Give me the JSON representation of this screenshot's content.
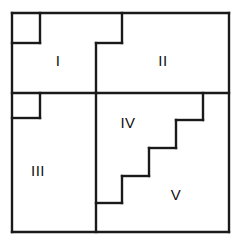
{
  "figure": {
    "background_color": "#ffffff",
    "line_color": "#1a1a1a",
    "label_color": "#111111",
    "canvas": {
      "width": 241,
      "height": 245
    },
    "outer_frame": {
      "left": 12,
      "top": 13,
      "right": 229,
      "bottom": 232
    }
  },
  "regions": [
    {
      "id": "region-1",
      "label": "I",
      "label_x": 58,
      "label_y": 62,
      "outline": "M 40 13 L 122 13 L 122 43 L 96 43 L 96 93 L 40 93 Z",
      "notes": "upper-left region beside the small empty square notch"
    },
    {
      "id": "region-2",
      "label": "II",
      "label_x": 163,
      "label_y": 62,
      "outline": "M 122 13 L 229 13 L 229 93 L 96 93 L 96 43 L 122 43 Z",
      "notes": "upper-right region"
    },
    {
      "id": "region-3",
      "label": "III",
      "label_x": 38,
      "label_y": 172,
      "outline": "M 12 118 L 40 118 L 40 93 L 96 93 L 96 232 L 12 232 Z",
      "notes": "lower-left region"
    },
    {
      "id": "region-4",
      "label": "IV",
      "label_x": 128,
      "label_y": 124,
      "outline": "M 96 93 L 229 93 L 229 94 L 203 94 L 203 120 L 176 120 L 176 148 L 149 148 L 149 176 L 122 176 L 122 203 L 96 203 Z",
      "notes": "middle region bounded below-right by a descending staircase"
    },
    {
      "id": "region-5",
      "label": "V",
      "label_x": 176,
      "label_y": 196,
      "outline": "M 203 94 L 229 94 L 229 232 L 96 232 L 96 203 L 122 203 L 122 176 L 149 176 L 149 148 L 176 148 L 176 120 L 203 120 Z",
      "notes": "lower-right region under the staircase"
    }
  ],
  "notch": {
    "id": "corner-notch",
    "label": "",
    "rect": {
      "x": 12,
      "y": 13,
      "width": 28,
      "height": 30
    },
    "notes": "small empty square cut out of the top-left corner"
  },
  "segments": [
    {
      "name": "outer-top-border",
      "d": "M 12 13 L 229 13"
    },
    {
      "name": "outer-right-border",
      "d": "M 229 13 L 229 232"
    },
    {
      "name": "outer-bottom-border",
      "d": "M 229 232 L 12 232"
    },
    {
      "name": "outer-left-border",
      "d": "M 12 232 L 12 13"
    },
    {
      "name": "notch-bottom-edge",
      "d": "M 12 43 L 40 43"
    },
    {
      "name": "notch-right-edge",
      "d": "M 40 13 L 40 43"
    },
    {
      "name": "region1-right-step-top",
      "d": "M 122 13 L 122 43"
    },
    {
      "name": "region1-step-horizontal",
      "d": "M 122 43 L 96 43"
    },
    {
      "name": "region1-right-edge",
      "d": "M 96 43 L 96 93"
    },
    {
      "name": "main-horizontal-divider",
      "d": "M 12 93 L 229 93"
    },
    {
      "name": "left-step-vertical",
      "d": "M 40 93 L 40 118"
    },
    {
      "name": "left-step-horizontal",
      "d": "M 40 118 L 12 118"
    },
    {
      "name": "center-vertical-divider",
      "d": "M 96 93 L 96 232"
    },
    {
      "name": "stair-riser-1",
      "d": "M 203 93 L 203 120"
    },
    {
      "name": "stair-tread-1",
      "d": "M 203 120 L 176 120"
    },
    {
      "name": "stair-riser-2",
      "d": "M 176 120 L 176 148"
    },
    {
      "name": "stair-tread-2",
      "d": "M 176 148 L 149 148"
    },
    {
      "name": "stair-riser-3",
      "d": "M 149 148 L 149 176"
    },
    {
      "name": "stair-tread-3",
      "d": "M 149 176 L 122 176"
    },
    {
      "name": "stair-riser-4",
      "d": "M 122 176 L 122 203"
    },
    {
      "name": "stair-tread-4",
      "d": "M 122 203 L 96 203"
    }
  ]
}
